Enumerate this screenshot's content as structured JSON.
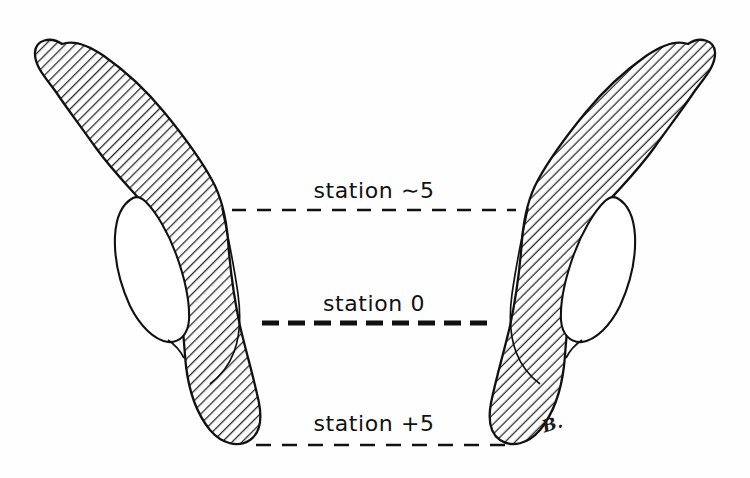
{
  "figure": {
    "background_color": "#fefefe",
    "ink_color": "#111111",
    "hatch_color": "#2b2b2b",
    "artist_mark": "B."
  },
  "stations": [
    {
      "id": "station-minus-5",
      "label": "station ∼5",
      "line_y": 210,
      "line_x_start": 232,
      "line_x_end": 516,
      "line_weight": "thin",
      "dash_pattern": "14 11"
    },
    {
      "id": "station-zero",
      "label": "station 0",
      "line_y": 323,
      "line_x_start": 262,
      "line_x_end": 492,
      "line_weight": "thick",
      "dash_pattern": "17 9"
    },
    {
      "id": "station-plus-5",
      "label": "station +5",
      "line_y": 445,
      "line_x_start": 256,
      "line_x_end": 508,
      "line_weight": "thin",
      "dash_pattern": "15 11"
    }
  ],
  "shapes": [
    {
      "id": "left-structure",
      "side": "left",
      "fill": "diagonal-hatch",
      "description": "hatched curving bone cross-section with white interior cavity"
    },
    {
      "id": "right-structure",
      "side": "right",
      "fill": "diagonal-hatch",
      "description": "mirrored hatched curving bone cross-section with white interior cavity"
    }
  ]
}
